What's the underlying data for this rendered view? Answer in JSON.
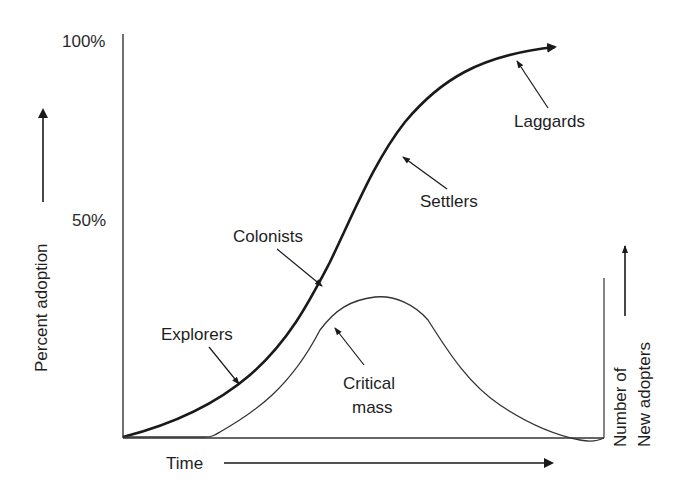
{
  "diagram": {
    "title": "",
    "y_axis": {
      "label": "Percent adoption",
      "ticks": [
        "100%",
        "50%"
      ]
    },
    "x_axis": {
      "label": "Time"
    },
    "right_axis": {
      "label_line1": "Number of",
      "label_line2": "New adopters"
    },
    "annotations": [
      {
        "label": "Explorers",
        "target_curve": "cumulative adoption"
      },
      {
        "label": "Colonists",
        "target_curve": "cumulative adoption"
      },
      {
        "label": "Settlers",
        "target_curve": "cumulative adoption"
      },
      {
        "label": "Laggards",
        "target_curve": "cumulative adoption"
      },
      {
        "label_line1": "Critical",
        "label_line2": "mass",
        "target_curve": "new adopters"
      }
    ],
    "curves": [
      {
        "name": "cumulative adoption",
        "shape": "S-curve",
        "style": "thick"
      },
      {
        "name": "new adopters",
        "shape": "bell",
        "style": "thin"
      }
    ],
    "colors": {
      "ink": "#1a1a1a",
      "background": "#ffffff"
    }
  }
}
